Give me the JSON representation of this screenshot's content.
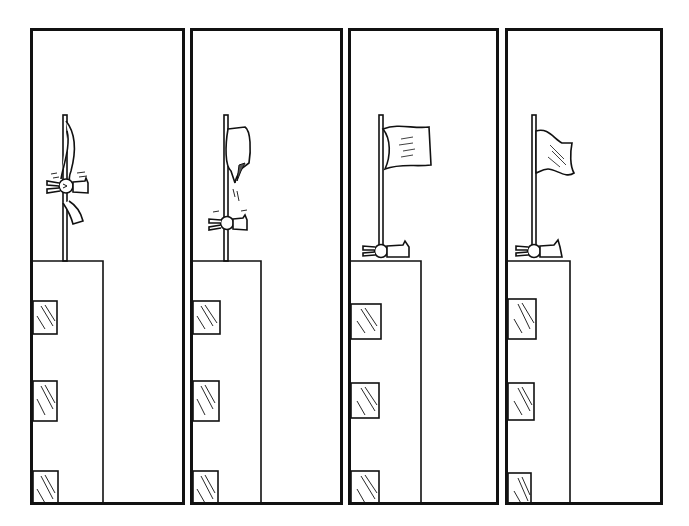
{
  "comic": {
    "title": "",
    "panel_count": 4,
    "style": "black-and-white line art",
    "panels": [
      {
        "index": 1,
        "description": "A bunny spins around a flagpole on a rooftop, wrapped in a twisted flag.",
        "flag_state": "twisted",
        "bunny_position": "mid-pole spinning"
      },
      {
        "index": 2,
        "description": "The bunny slides lower on the pole; the flag unfurls and droops.",
        "flag_state": "drooping",
        "bunny_position": "low on pole"
      },
      {
        "index": 3,
        "description": "The flag flies fully; the bunny lies flat at the base of the pole.",
        "flag_state": "flying",
        "bunny_position": "lying at base"
      },
      {
        "index": 4,
        "description": "The flag waves; the bunny remains lying at the base.",
        "flag_state": "waving",
        "bunny_position": "lying at base"
      }
    ]
  },
  "colors": {
    "ink": "#111111",
    "paper": "#ffffff"
  }
}
